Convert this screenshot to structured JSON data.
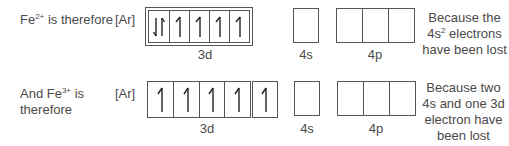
{
  "rows": [
    {
      "label_prefix": "Fe",
      "label_charge": "2+",
      "label_suffix": " is therefore",
      "core": "[Ar]",
      "orbitals": {
        "3d": {
          "name": "3d",
          "cells": [
            "up-down",
            "up",
            "up",
            "up",
            "up"
          ]
        },
        "4s": {
          "name": "4s",
          "cells": [
            "empty"
          ]
        },
        "4p": {
          "name": "4p",
          "cells": [
            "empty",
            "empty",
            "empty"
          ]
        }
      },
      "note_line1": "Because the",
      "note_line2_prefix": "4s",
      "note_line2_sup": "2",
      "note_line2_suffix": " electrons",
      "note_line3": "have been lost"
    },
    {
      "label_line1_prefix": "And Fe",
      "label_charge": "3+",
      "label_line1_suffix": " is",
      "label_line2": "therefore",
      "core": "[Ar]",
      "orbitals": {
        "3d": {
          "name": "3d",
          "cells": [
            "up",
            "up",
            "up",
            "up",
            "up"
          ]
        },
        "4s": {
          "name": "4s",
          "cells": [
            "empty"
          ]
        },
        "4p": {
          "name": "4p",
          "cells": [
            "empty",
            "empty",
            "empty"
          ]
        }
      },
      "note_line1": "Because two",
      "note_line2": "4s and one 3d",
      "note_line3": "electron have",
      "note_line4": "been lost"
    }
  ],
  "colors": {
    "line": "#555555",
    "text": "#4a4a4a",
    "arrow": "#222222"
  }
}
